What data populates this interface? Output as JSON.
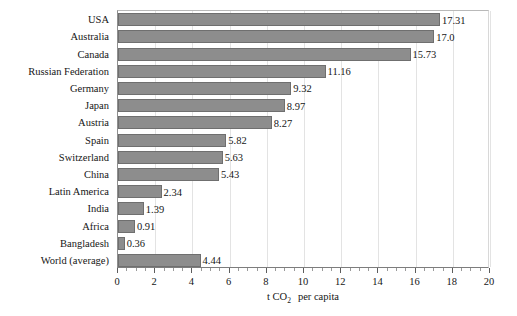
{
  "chart_data": {
    "type": "bar",
    "orientation": "horizontal",
    "title": "",
    "subtitle": "",
    "xlabel": "t CO2 per capita",
    "xlabel_parts": {
      "pre": "t CO",
      "sub": "2",
      "post": "per capita"
    },
    "ylabel": "",
    "xlim": [
      0,
      20
    ],
    "xticks": [
      0,
      2,
      4,
      6,
      8,
      10,
      12,
      14,
      16,
      18,
      20
    ],
    "xtick_labels": [
      "0",
      "2",
      "4",
      "6",
      "8",
      "10",
      "12",
      "14",
      "16",
      "18",
      "20"
    ],
    "minor_tick_step": 0.5,
    "grid": {
      "vertical": true,
      "horizontal": false
    },
    "legend": null,
    "bar_color": "#8d8d8d",
    "bar_edge_color": "#6f6f6f",
    "show_data_labels": true,
    "categories": [
      "USA",
      "Australia",
      "Canada",
      "Russian Federation",
      "Germany",
      "Japan",
      "Austria",
      "Spain",
      "Switzerland",
      "China",
      "Latin America",
      "India",
      "Africa",
      "Bangladesh",
      "World (average)"
    ],
    "values": [
      17.31,
      17.0,
      15.73,
      11.16,
      9.32,
      8.97,
      8.27,
      5.82,
      5.63,
      5.43,
      2.34,
      1.39,
      0.91,
      0.36,
      4.44
    ],
    "value_labels": [
      "17.31",
      "17.0",
      "15.73",
      "11.16",
      "9.32",
      "8.97",
      "8.27",
      "5.82",
      "5.63",
      "5.43",
      "2.34",
      "1.39",
      "0.91",
      "0.36",
      "4.44"
    ]
  }
}
